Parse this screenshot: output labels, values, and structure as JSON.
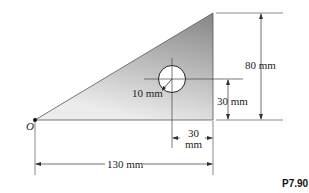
{
  "figure": {
    "label": "P7.90",
    "origin_label": "O",
    "dimensions": {
      "height_total": "80 mm",
      "hole_height": "30 mm",
      "hole_offset_line1": "30",
      "hole_offset_line2": "mm",
      "base_width": "130 mm",
      "hole_radius": "10 mm"
    },
    "colors": {
      "fill_dark": "#8a8a8a",
      "fill_light": "#e6e6e6",
      "line": "#333333"
    }
  }
}
